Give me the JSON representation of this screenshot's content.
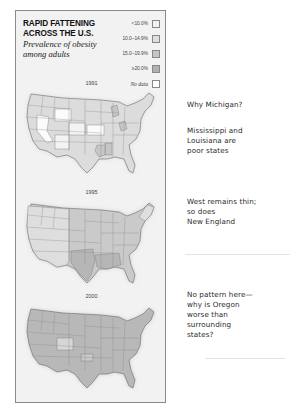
{
  "panel": {
    "title_line1": "RAPID FATTENING",
    "title_line2": "ACROSS THE U.S.",
    "subtitle": "Prevalence of obesity among adults"
  },
  "legend": [
    {
      "label": "<10.0%",
      "color": "#f3f3f3"
    },
    {
      "label": "10.0–14.9%",
      "color": "#dedede"
    },
    {
      "label": "15.0–19.9%",
      "color": "#c6c6c6"
    },
    {
      "label": "≥20.0%",
      "color": "#b0b0b0"
    },
    {
      "label": "No data",
      "color": "#ffffff"
    }
  ],
  "maps": [
    {
      "year": "1991",
      "base_color": "#dcdcdc",
      "highlight_white": [
        "NV",
        "WY",
        "KS",
        "CO",
        "NM",
        "UT",
        "MT",
        "AZ"
      ],
      "dark": [
        "MS",
        "LA",
        "MI",
        "WV"
      ]
    },
    {
      "year": "1995",
      "base_color": "#c9c9c9",
      "light": [
        "WA",
        "OR",
        "CA",
        "NV",
        "ID",
        "MT",
        "WY",
        "UT",
        "CO",
        "AZ",
        "NM",
        "ME",
        "VT",
        "NH",
        "MA"
      ],
      "dark": [
        "TX",
        "OK",
        "MS",
        "LA",
        "AL",
        "IN",
        "KY",
        "WV",
        "MI"
      ]
    },
    {
      "year": "2000",
      "base_color": "#b6b6b6",
      "light": [
        "CO",
        "OK",
        "VT"
      ]
    }
  ],
  "annotations": [
    {
      "lines": [
        "Why Michigan?"
      ]
    },
    {
      "lines": [
        "Mississippi and",
        "Louisiana are",
        "poor states"
      ]
    },
    {
      "lines": [
        "West remains thin;",
        "so does",
        "New England"
      ]
    },
    {
      "lines": [
        "No pattern here—",
        "why is Oregon",
        "worse than",
        "surrounding",
        "states?"
      ]
    }
  ]
}
